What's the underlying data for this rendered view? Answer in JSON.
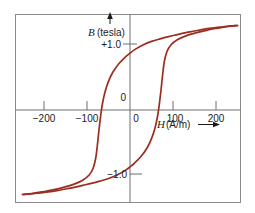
{
  "figure": {
    "background_color": "#ffffff",
    "frame_color": "#808080",
    "axis_color": "#6e6e6e",
    "curve_color": "#9c2d1f",
    "text_color": "#1a1a1a"
  },
  "labels": {
    "y_axis_symbol": "B",
    "y_axis_unit": "(tesla)",
    "x_axis_symbol": "H",
    "x_axis_unit": "(A/m)",
    "x_axis_arrow": "⟶",
    "y_axis_arrow": "↑",
    "y_tick_plus_one": "+1.0",
    "y_tick_zero": "0",
    "y_tick_minus_one": "−1.0",
    "x_tick_minus_200": "−200",
    "x_tick_minus_100": "−100",
    "x_tick_zero": "0",
    "x_tick_100": "100",
    "x_tick_200": "200"
  },
  "chart_data": {
    "type": "line",
    "title": "",
    "subtitle": "",
    "xlabel": "H (A/m)",
    "ylabel": "B (tesla)",
    "xlim": [
      -250,
      250
    ],
    "ylim": [
      -1.45,
      1.45
    ],
    "xticks": [
      -200,
      -100,
      0,
      100,
      200
    ],
    "xticklabels": [
      "−200",
      "−100",
      "0",
      "100",
      "200"
    ],
    "yticks": [
      1.0,
      0,
      -1.0
    ],
    "yticklabels": [
      "+1.0",
      "0",
      "−1.0"
    ],
    "grid": false,
    "legend": null,
    "annotations": [],
    "key_values": {
      "coercivity_H_c_positive": 75,
      "coercivity_H_c_negative": -75,
      "remanence_B_r_positive": 0.85,
      "remanence_B_r_negative": -0.85,
      "saturation_B_positive": 1.3,
      "saturation_B_negative": -1.3
    },
    "series": [
      {
        "name": "upper-branch-decreasing-H",
        "color": "#9c2d1f",
        "points": [
          [
            250,
            1.3
          ],
          [
            230,
            1.29
          ],
          [
            210,
            1.275
          ],
          [
            190,
            1.26
          ],
          [
            170,
            1.24
          ],
          [
            150,
            1.215
          ],
          [
            130,
            1.19
          ],
          [
            110,
            1.16
          ],
          [
            90,
            1.13
          ],
          [
            70,
            1.095
          ],
          [
            50,
            1.055
          ],
          [
            30,
            1.0
          ],
          [
            10,
            0.925
          ],
          [
            0,
            0.875
          ],
          [
            -10,
            0.82
          ],
          [
            -25,
            0.72
          ],
          [
            -40,
            0.58
          ],
          [
            -50,
            0.44
          ],
          [
            -58,
            0.28
          ],
          [
            -64,
            0.1
          ],
          [
            -68,
            -0.08
          ],
          [
            -72,
            -0.3
          ],
          [
            -76,
            -0.55
          ],
          [
            -80,
            -0.75
          ],
          [
            -86,
            -0.9
          ],
          [
            -95,
            -1.0
          ],
          [
            -110,
            -1.08
          ],
          [
            -130,
            -1.14
          ],
          [
            -155,
            -1.19
          ],
          [
            -180,
            -1.23
          ],
          [
            -205,
            -1.26
          ],
          [
            -228,
            -1.285
          ],
          [
            -250,
            -1.3
          ]
        ]
      },
      {
        "name": "lower-branch-increasing-H",
        "color": "#9c2d1f",
        "points": [
          [
            -250,
            -1.3
          ],
          [
            -230,
            -1.29
          ],
          [
            -210,
            -1.275
          ],
          [
            -190,
            -1.26
          ],
          [
            -170,
            -1.24
          ],
          [
            -150,
            -1.215
          ],
          [
            -130,
            -1.19
          ],
          [
            -110,
            -1.16
          ],
          [
            -90,
            -1.13
          ],
          [
            -70,
            -1.095
          ],
          [
            -50,
            -1.055
          ],
          [
            -30,
            -1.0
          ],
          [
            -10,
            -0.925
          ],
          [
            0,
            -0.875
          ],
          [
            10,
            -0.82
          ],
          [
            25,
            -0.72
          ],
          [
            40,
            -0.58
          ],
          [
            50,
            -0.44
          ],
          [
            58,
            -0.28
          ],
          [
            64,
            -0.1
          ],
          [
            68,
            0.08
          ],
          [
            72,
            0.3
          ],
          [
            76,
            0.55
          ],
          [
            80,
            0.75
          ],
          [
            86,
            0.9
          ],
          [
            95,
            1.0
          ],
          [
            110,
            1.08
          ],
          [
            130,
            1.14
          ],
          [
            155,
            1.19
          ],
          [
            180,
            1.23
          ],
          [
            205,
            1.26
          ],
          [
            228,
            1.285
          ],
          [
            250,
            1.3
          ]
        ]
      }
    ]
  }
}
